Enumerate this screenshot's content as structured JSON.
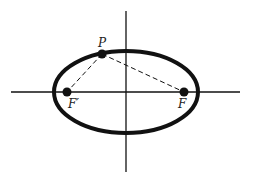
{
  "diagram": {
    "colors": {
      "stroke": "#111111",
      "background": "#ffffff"
    },
    "axes": {
      "horizontal": {
        "x1": 11,
        "y1": 92,
        "x2": 240,
        "y2": 92
      },
      "vertical": {
        "x1": 126,
        "y1": 11,
        "x2": 126,
        "y2": 172
      }
    },
    "ellipse": {
      "cx": 126,
      "cy": 92,
      "rx": 72,
      "ry": 41
    },
    "points": {
      "P": {
        "label": "P",
        "x": 102,
        "y": 54,
        "label_x": 98,
        "label_y": 47
      },
      "F_prime": {
        "label": "F′",
        "x": 67,
        "y": 92,
        "label_x": 68,
        "label_y": 108
      },
      "F": {
        "label": "F",
        "x": 184,
        "y": 92,
        "label_x": 178,
        "label_y": 108
      }
    },
    "segments": [
      {
        "from": "P",
        "to": "F_prime",
        "style": "dashed"
      },
      {
        "from": "P",
        "to": "F",
        "style": "dashed"
      }
    ]
  }
}
